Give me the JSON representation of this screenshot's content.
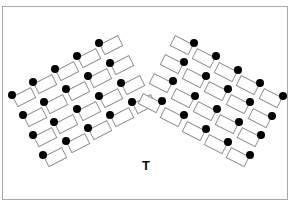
{
  "teacher_label": "T",
  "teacher_position": {
    "x": 146,
    "y": 165
  },
  "colors": {
    "desk_stroke": "#8a8a8a",
    "student_fill": "#000000",
    "frame_stroke": "#a8a8a8",
    "background": "#ffffff"
  },
  "desk": {
    "width": 20,
    "height": 11
  },
  "left_cluster": {
    "rotation_deg": -27,
    "students": [
      {
        "x": 12,
        "y": 95
      },
      {
        "x": 33,
        "y": 82
      },
      {
        "x": 55,
        "y": 69
      },
      {
        "x": 77,
        "y": 56
      },
      {
        "x": 99,
        "y": 43
      },
      {
        "x": 23,
        "y": 115
      },
      {
        "x": 44,
        "y": 102
      },
      {
        "x": 66,
        "y": 89
      },
      {
        "x": 88,
        "y": 76
      },
      {
        "x": 110,
        "y": 63
      },
      {
        "x": 33,
        "y": 135
      },
      {
        "x": 54,
        "y": 122
      },
      {
        "x": 77,
        "y": 109
      },
      {
        "x": 99,
        "y": 96
      },
      {
        "x": 121,
        "y": 83
      },
      {
        "x": 43,
        "y": 155
      },
      {
        "x": 66,
        "y": 141
      },
      {
        "x": 88,
        "y": 128
      },
      {
        "x": 110,
        "y": 115
      },
      {
        "x": 132,
        "y": 102
      }
    ]
  },
  "right_cluster": {
    "rotation_deg": 27,
    "students": [
      {
        "x": 194,
        "y": 43
      },
      {
        "x": 216,
        "y": 56
      },
      {
        "x": 238,
        "y": 70
      },
      {
        "x": 260,
        "y": 83
      },
      {
        "x": 283,
        "y": 96
      },
      {
        "x": 184,
        "y": 62
      },
      {
        "x": 206,
        "y": 76
      },
      {
        "x": 228,
        "y": 89
      },
      {
        "x": 250,
        "y": 102
      },
      {
        "x": 272,
        "y": 116
      },
      {
        "x": 173,
        "y": 81
      },
      {
        "x": 195,
        "y": 96
      },
      {
        "x": 217,
        "y": 109
      },
      {
        "x": 239,
        "y": 122
      },
      {
        "x": 261,
        "y": 135
      },
      {
        "x": 162,
        "y": 101
      },
      {
        "x": 184,
        "y": 115
      },
      {
        "x": 206,
        "y": 129
      },
      {
        "x": 228,
        "y": 142
      },
      {
        "x": 250,
        "y": 155
      }
    ]
  }
}
